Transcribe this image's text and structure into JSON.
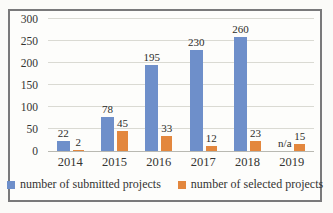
{
  "chart_data": {
    "type": "bar",
    "title": "",
    "xlabel": "",
    "ylabel": "",
    "categories": [
      "2014",
      "2015",
      "2016",
      "2017",
      "2018",
      "2019"
    ],
    "series": [
      {
        "name": "number of submitted projects",
        "color": "#6e8fca",
        "values": [
          22,
          78,
          195,
          230,
          260,
          null
        ],
        "labels": [
          "22",
          "78",
          "195",
          "230",
          "260",
          "n/a"
        ]
      },
      {
        "name": "number of selected projects",
        "color": "#e3873e",
        "values": [
          2,
          45,
          33,
          12,
          23,
          15
        ],
        "labels": [
          "2",
          "45",
          "33",
          "12",
          "23",
          "15"
        ]
      }
    ],
    "ylim": [
      0,
      300
    ],
    "yticks": [
      0,
      50,
      100,
      150,
      200,
      250,
      300
    ],
    "grid": "horizontal",
    "legend_position": "bottom"
  },
  "colors": {
    "frame_border": "#79797a",
    "gridline": "#dadad3",
    "axis_line": "#b9b9b2",
    "submitted_blue": "#6e8fca",
    "selected_orange": "#e3873e"
  }
}
